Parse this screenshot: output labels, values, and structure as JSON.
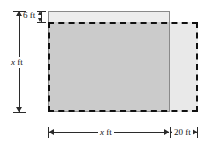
{
  "figure": {
    "colors": {
      "overlap_fill": "#cbcbcb",
      "extension_fill": "#e9e9e9",
      "top_strip_fill": "#ededed",
      "solid_outline": "#8a8a8a",
      "dashed_outline": "#111111",
      "dimension_line": "#2b2b2b"
    },
    "shapes": [
      {
        "name": "original-plot",
        "style": "solid-outline",
        "fill": "#cbcbcb"
      },
      {
        "name": "enlarged-plot",
        "style": "dashed-outline",
        "fill": "#e9e9e9"
      }
    ],
    "dimensions": [
      {
        "name": "height-label",
        "variable": "x",
        "unit": "ft",
        "text": "x ft",
        "orientation": "vertical",
        "position": "left"
      },
      {
        "name": "top-offset-label",
        "value": "6",
        "unit": "ft",
        "text": "6 ft",
        "orientation": "vertical",
        "position": "top-left-inset"
      },
      {
        "name": "width-label",
        "variable": "x",
        "unit": "ft",
        "text": "x ft",
        "orientation": "horizontal",
        "position": "bottom"
      },
      {
        "name": "extension-width-label",
        "value": "20",
        "unit": "ft",
        "text": "20 ft",
        "orientation": "horizontal",
        "position": "bottom-right"
      }
    ],
    "labels": {
      "height_var": "x",
      "height_unit": " ft",
      "top_offset": "6 ft",
      "width_var": "x",
      "width_unit": " ft",
      "extension_width": "20 ft"
    }
  }
}
